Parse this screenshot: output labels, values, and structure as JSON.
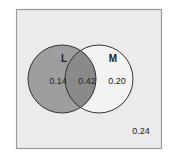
{
  "diagram": {
    "type": "venn",
    "sets": [
      {
        "id": "L",
        "label": "L",
        "only_value": "0.14"
      },
      {
        "id": "M",
        "label": "M",
        "only_value": "0.20"
      }
    ],
    "intersection_value": "0.42",
    "outside_value": "0.24",
    "colors": {
      "background_box": "#ebebeb",
      "box_border": "#9a9a9a",
      "circle_L_fill": "#9e9e9e",
      "intersection_fill": "#8a8a8a",
      "circle_M_fill": "#f3f3f3",
      "outline": "#333333"
    }
  }
}
